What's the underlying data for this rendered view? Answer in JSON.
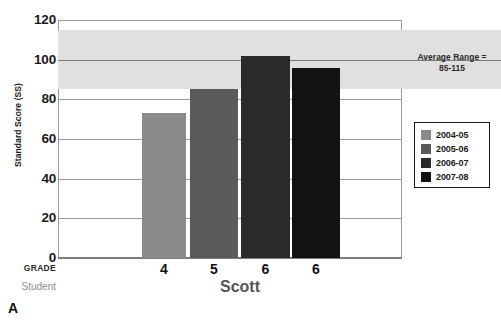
{
  "figure": {
    "panel_label": "A",
    "student_caption": "Student",
    "grade_caption": "GRADE",
    "student_name": "Scott"
  },
  "annotation": {
    "line1": "Average Range =",
    "line2": "85-115"
  },
  "legend": {
    "items": [
      {
        "label": "2004-05",
        "color": "#8a8a8a"
      },
      {
        "label": "2005-06",
        "color": "#5a5a5a"
      },
      {
        "label": "2006-07",
        "color": "#2a2a2a"
      },
      {
        "label": "2007-08",
        "color": "#121212"
      }
    ]
  },
  "chart_data": {
    "type": "bar",
    "title": "",
    "xlabel": "GRADE",
    "ylabel": "Standard Score (SS)",
    "categories": [
      "4",
      "5",
      "6",
      "6"
    ],
    "series": [
      {
        "name": "Standard Score",
        "values": [
          73,
          85,
          102,
          96
        ],
        "point_colors": [
          "#8a8a8a",
          "#5a5a5a",
          "#2a2a2a",
          "#121212"
        ],
        "point_years": [
          "2004-05",
          "2005-06",
          "2006-07",
          "2007-08"
        ]
      }
    ],
    "ylim": [
      0,
      120
    ],
    "yticks": [
      0,
      20,
      40,
      60,
      80,
      100,
      120
    ],
    "ytick_labels": [
      "0",
      "20",
      "40",
      "60",
      "80",
      "100",
      "120"
    ],
    "grid": true,
    "legend_position": "right",
    "shaded_band": {
      "label": "Average Range",
      "from": 85,
      "to": 115,
      "color": "#e0e0e0"
    },
    "reference_line": 100
  }
}
